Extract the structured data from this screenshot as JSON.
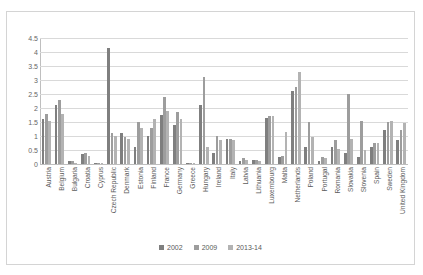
{
  "chart_data": {
    "type": "bar",
    "title": "",
    "xlabel": "",
    "ylabel": "",
    "ylim": [
      0,
      4.5
    ],
    "yticks": [
      "0",
      "0.5",
      "1",
      "1.5",
      "2",
      "2.5",
      "3",
      "3.5",
      "4",
      "4.5"
    ],
    "grid": true,
    "legend_position": "bottom",
    "categories": [
      "Austria",
      "Belgium",
      "Bulgaria",
      "Croatia",
      "Cyprus",
      "Czech Republic",
      "Denmark",
      "Estonia",
      "Finland",
      "France",
      "Germany",
      "Greece",
      "Hungary",
      "Ireland",
      "Italy",
      "Latvia",
      "Lithuania",
      "Luxembourg",
      "Malta",
      "Netherlands",
      "Poland",
      "Portugal",
      "Romania",
      "Slovakia",
      "Slovenia",
      "Spain",
      "Sweden",
      "United Kingdom"
    ],
    "series": [
      {
        "name": "2002",
        "color": "#7f7f7f",
        "values": [
          1.6,
          2.1,
          0.1,
          0.35,
          0.05,
          4.15,
          1.1,
          0.6,
          1.0,
          1.75,
          1.4,
          0.05,
          2.1,
          0.4,
          0.9,
          0.1,
          0.15,
          1.65,
          0.25,
          2.6,
          0.6,
          0.1,
          0.6,
          0.4,
          0.25,
          0.6,
          1.2,
          0.85
        ]
      },
      {
        "name": "2009",
        "color": "#9d9d9d",
        "values": [
          1.8,
          2.3,
          0.1,
          0.4,
          0.05,
          1.1,
          0.95,
          1.5,
          1.3,
          2.4,
          1.85,
          0.05,
          3.1,
          1.0,
          0.9,
          0.2,
          0.15,
          1.7,
          0.3,
          2.75,
          1.5,
          0.25,
          0.85,
          2.5,
          1.55,
          0.75,
          1.5,
          1.2
        ]
      },
      {
        "name": "2013-14",
        "color": "#b3b3b3",
        "values": [
          1.55,
          1.8,
          0.05,
          0.3,
          0.05,
          1.0,
          0.9,
          1.3,
          1.6,
          1.9,
          1.6,
          0.05,
          0.6,
          0.85,
          0.85,
          0.15,
          0.1,
          1.7,
          1.15,
          3.3,
          0.95,
          0.2,
          0.55,
          0.9,
          0.5,
          0.75,
          1.55,
          1.45
        ]
      }
    ]
  }
}
